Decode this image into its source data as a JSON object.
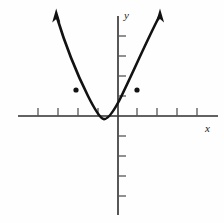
{
  "figure": {
    "title": "",
    "background_color": "#fefefe",
    "stroke_color": "#121212",
    "axis_color": "#3a3a3a",
    "width": 224,
    "height": 223
  },
  "axes": {
    "x_label": "x",
    "y_label": "y",
    "origin_px": {
      "x": 118,
      "y": 116
    },
    "tick_spacing_px": 20,
    "x_axis_extent_px": {
      "start": 18,
      "end": 218
    },
    "y_axis_extent_px": {
      "start": 16,
      "end": 215
    },
    "x_ticks_px": [
      38,
      58,
      78,
      98,
      137,
      157,
      177,
      197
    ],
    "y_ticks_px": [
      36,
      56,
      76,
      96,
      136,
      156,
      176,
      196
    ],
    "tick_length_px": 8,
    "grid": "off",
    "x_ticks_values": [
      -4,
      -3,
      -2,
      -1,
      1,
      2,
      3,
      4
    ],
    "y_ticks_values": [
      4,
      3,
      2,
      1,
      -1,
      -2,
      -3,
      -4
    ]
  },
  "chart_data": {
    "type": "line",
    "title": "",
    "xlabel": "x",
    "ylabel": "y",
    "xlim": [
      -5,
      5
    ],
    "ylim": [
      -5,
      5.2
    ],
    "grid": false,
    "legend": "none",
    "curve_name": "parabola",
    "vertex": {
      "x": -0.75,
      "y": -0.15
    },
    "direction": "opens-upward",
    "series": [
      {
        "name": "parabola",
        "x": [
          -2.6,
          -2.4,
          -2.2,
          -2.0,
          -1.8,
          -1.6,
          -1.4,
          -1.2,
          -1.0,
          -0.75,
          -0.5,
          -0.25,
          0,
          0.25,
          0.5,
          0.75,
          1.0,
          1.25,
          1.5,
          1.75,
          2.0
        ],
        "y": [
          5.2,
          4.2,
          3.3,
          2.5,
          1.8,
          1.2,
          0.7,
          0.3,
          0.02,
          -0.15,
          0.02,
          0.3,
          0.7,
          1.2,
          1.8,
          2.5,
          3.3,
          4.2,
          5.2,
          6.3,
          7.5
        ]
      }
    ],
    "marked_points": [
      {
        "label": "",
        "px": {
          "x": 76,
          "y": 90
        },
        "x": -2.1,
        "y": 1.3
      },
      {
        "label": "",
        "px": {
          "x": 137,
          "y": 90
        },
        "x": 0.95,
        "y": 1.3
      }
    ],
    "arrows": [
      {
        "name": "left-branch-arrow",
        "tip_px": {
          "x": 56,
          "y": 10
        }
      },
      {
        "name": "right-branch-arrow",
        "tip_px": {
          "x": 160,
          "y": 10
        }
      }
    ]
  },
  "geometry": {
    "curve_path": "M 56.5 16 C 62 34, 73 66, 88 96 C 95 110, 100 118, 103.5 119 C 107 120, 112 114, 119 101 C 131 77, 146 42, 159.5 16",
    "left_arrow_points": "56.2,8.5 52.2,22.5 56.3,19.0 60.4,22.5",
    "right_arrow_points": "160.0,8.5 155.9,22.5 160.0,19.0 164.1,22.5"
  }
}
